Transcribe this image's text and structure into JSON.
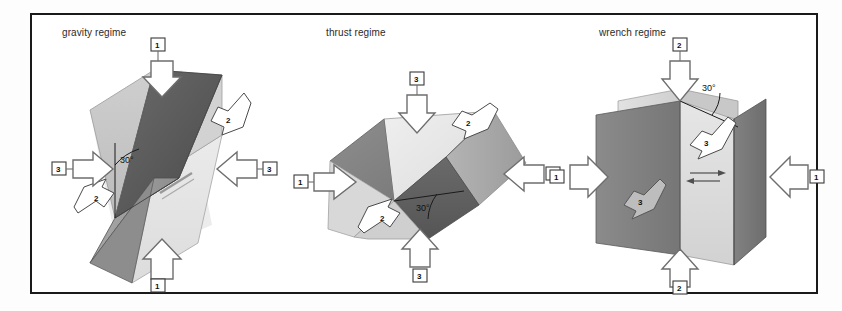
{
  "figure": {
    "type": "diagram",
    "panel_count": 3,
    "frame_color": "#1a1a1a",
    "background_color": "#ffffff"
  },
  "panels": [
    {
      "id": "gravity",
      "title": "gravity regime",
      "angle_label": "30°",
      "stress_arrows": [
        {
          "axis": "1",
          "label": "1",
          "position": "top",
          "direction": "down"
        },
        {
          "axis": "1",
          "label": "1",
          "position": "bottom",
          "direction": "up"
        },
        {
          "axis": "3",
          "label": "3",
          "position": "left",
          "direction": "right"
        },
        {
          "axis": "3",
          "label": "3",
          "position": "right",
          "direction": "left"
        }
      ],
      "slip_arrows": [
        {
          "label": "2",
          "position": "upper-right"
        },
        {
          "label": "2",
          "position": "lower-left"
        }
      ]
    },
    {
      "id": "thrust",
      "title": "thrust regime",
      "angle_label": "30°",
      "stress_arrows": [
        {
          "axis": "3",
          "label": "3",
          "position": "top",
          "direction": "down"
        },
        {
          "axis": "3",
          "label": "3",
          "position": "bottom",
          "direction": "up"
        },
        {
          "axis": "1",
          "label": "1",
          "position": "left",
          "direction": "right"
        },
        {
          "axis": "1",
          "label": "1",
          "position": "right",
          "direction": "left"
        }
      ],
      "slip_arrows": [
        {
          "label": "2",
          "position": "upper-right"
        },
        {
          "label": "2",
          "position": "lower-left"
        }
      ]
    },
    {
      "id": "wrench",
      "title": "wrench regime",
      "angle_label": "30°",
      "stress_arrows": [
        {
          "axis": "2",
          "label": "2",
          "position": "top",
          "direction": "down"
        },
        {
          "axis": "2",
          "label": "2",
          "position": "bottom",
          "direction": "up"
        },
        {
          "axis": "1",
          "label": "1",
          "position": "left",
          "direction": "right"
        },
        {
          "axis": "1",
          "label": "1",
          "position": "right",
          "direction": "left"
        }
      ],
      "slip_arrows": [
        {
          "label": "3",
          "position": "right-plane"
        },
        {
          "label": "3",
          "position": "left-plane"
        }
      ]
    }
  ]
}
